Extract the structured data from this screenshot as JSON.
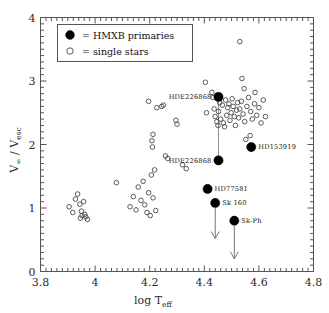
{
  "chart_data": {
    "type": "scatter",
    "title": "",
    "xlabel": "log T_eff",
    "xlabel_main": "log T",
    "xlabel_sub": "eff",
    "ylabel": "V_inf / V_esc",
    "ylabel_num": "V",
    "ylabel_num_sub": "∞",
    "ylabel_den": "V",
    "ylabel_den_sub": "esc",
    "xlim": [
      3.8,
      4.8
    ],
    "ylim": [
      0,
      4
    ],
    "xticks": [
      3.8,
      4.0,
      4.2,
      4.4,
      4.6,
      4.8
    ],
    "xticklabels": [
      "3.8",
      "4",
      "4.2",
      "4.4",
      "4.6",
      "4.8"
    ],
    "yticks": [
      0,
      1,
      2,
      3,
      4
    ],
    "yticklabels": [
      "0",
      "1",
      "2",
      "3",
      "4"
    ],
    "minor_ticks": true,
    "grid": false,
    "legend_position": "upper-left",
    "legend": [
      {
        "marker": "filled-circle",
        "label": "=  HMXB primaries"
      },
      {
        "marker": "open-circle",
        "label": "=  single stars"
      }
    ],
    "series": [
      {
        "name": "single stars",
        "marker": "open-circle",
        "points": [
          [
            3.905,
            1.02
          ],
          [
            3.918,
            0.93
          ],
          [
            3.928,
            1.14
          ],
          [
            3.936,
            1.22
          ],
          [
            3.944,
            1.06
          ],
          [
            3.95,
            0.95
          ],
          [
            3.952,
            0.88
          ],
          [
            3.958,
            1.1
          ],
          [
            3.962,
            0.9
          ],
          [
            3.966,
            0.86
          ],
          [
            3.972,
            0.82
          ],
          [
            3.946,
            0.84
          ],
          [
            4.078,
            1.4
          ],
          [
            4.128,
            1.02
          ],
          [
            4.14,
            1.18
          ],
          [
            4.15,
            0.97
          ],
          [
            4.158,
            1.33
          ],
          [
            4.168,
            1.12
          ],
          [
            4.176,
            1.42
          ],
          [
            4.182,
            1.05
          ],
          [
            4.19,
            0.93
          ],
          [
            4.196,
            1.24
          ],
          [
            4.202,
            0.88
          ],
          [
            4.206,
            1.52
          ],
          [
            4.212,
            1.16
          ],
          [
            4.218,
            1.6
          ],
          [
            4.222,
            0.96
          ],
          [
            4.196,
            2.68
          ],
          [
            4.208,
            2.06
          ],
          [
            4.21,
            1.96
          ],
          [
            4.212,
            2.16
          ],
          [
            4.226,
            2.58
          ],
          [
            4.244,
            2.6
          ],
          [
            4.25,
            2.62
          ],
          [
            4.258,
            1.82
          ],
          [
            4.266,
            1.78
          ],
          [
            4.296,
            2.38
          ],
          [
            4.3,
            2.32
          ],
          [
            4.32,
            1.68
          ],
          [
            4.334,
            1.62
          ],
          [
            4.404,
            2.98
          ],
          [
            4.408,
            2.5
          ],
          [
            4.428,
            2.82
          ],
          [
            4.432,
            2.74
          ],
          [
            4.436,
            2.56
          ],
          [
            4.44,
            2.44
          ],
          [
            4.446,
            2.36
          ],
          [
            4.45,
            2.3
          ],
          [
            4.452,
            2.52
          ],
          [
            4.456,
            2.66
          ],
          [
            4.46,
            2.4
          ],
          [
            4.466,
            2.62
          ],
          [
            4.47,
            2.34
          ],
          [
            4.474,
            2.28
          ],
          [
            4.478,
            2.7
          ],
          [
            4.482,
            2.46
          ],
          [
            4.486,
            2.58
          ],
          [
            4.49,
            2.64
          ],
          [
            4.494,
            2.38
          ],
          [
            4.498,
            2.5
          ],
          [
            4.502,
            2.72
          ],
          [
            4.506,
            2.6
          ],
          [
            4.51,
            2.44
          ],
          [
            4.514,
            2.3
          ],
          [
            4.518,
            2.54
          ],
          [
            4.522,
            2.66
          ],
          [
            4.526,
            2.42
          ],
          [
            4.53,
            2.56
          ],
          [
            4.536,
            2.68
          ],
          [
            4.542,
            2.48
          ],
          [
            4.548,
            2.36
          ],
          [
            4.556,
            2.6
          ],
          [
            4.562,
            2.74
          ],
          [
            4.57,
            2.52
          ],
          [
            4.576,
            2.4
          ],
          [
            4.584,
            2.64
          ],
          [
            4.592,
            2.46
          ],
          [
            4.6,
            2.58
          ],
          [
            4.608,
            2.34
          ],
          [
            4.616,
            2.7
          ],
          [
            4.624,
            2.44
          ],
          [
            4.538,
            3.04
          ],
          [
            4.546,
            2.88
          ],
          [
            4.586,
            2.82
          ],
          [
            4.552,
            2.08
          ],
          [
            4.568,
            2.14
          ],
          [
            4.53,
            3.62
          ]
        ]
      },
      {
        "name": "HMXB primaries",
        "marker": "filled-circle",
        "points": [
          {
            "x": 4.452,
            "y": 2.75,
            "label": "HDE226868",
            "label_pos": "left",
            "arrow": false
          },
          {
            "x": 4.452,
            "y": 1.75,
            "label": "HDE226868",
            "label_pos": "left",
            "arrow": false
          },
          {
            "x": 4.572,
            "y": 1.96,
            "label": "HD153919",
            "label_pos": "right",
            "arrow": false
          },
          {
            "x": 4.412,
            "y": 1.3,
            "label": "HD77581",
            "label_pos": "right",
            "arrow": false
          },
          {
            "x": 4.44,
            "y": 1.08,
            "label": "Sk 160",
            "label_pos": "right",
            "arrow": true,
            "arrow_to": 0.52
          },
          {
            "x": 4.51,
            "y": 0.8,
            "label": "Sk-Ph",
            "label_pos": "right",
            "arrow": true,
            "arrow_to": 0.2
          }
        ]
      }
    ],
    "connectors": [
      {
        "x": 4.452,
        "y_from": 2.75,
        "y_to": 1.75
      }
    ],
    "colors": {
      "filled_marker": "#000000",
      "open_marker": "#4a4a4a",
      "axis": "#555555",
      "background": "#ffffff"
    }
  }
}
